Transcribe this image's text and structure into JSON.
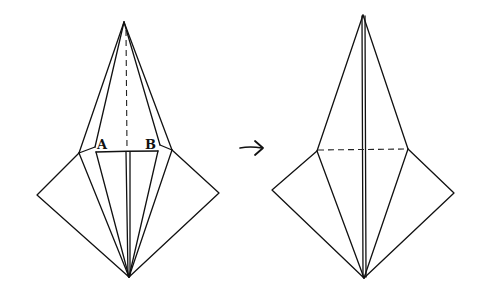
{
  "diagram": {
    "type": "origami-fold-step",
    "step_before": {
      "labels": [
        "A",
        "B"
      ],
      "fold_line": "vertical dashed valley line from apex to A-B edge"
    },
    "arrow": {
      "direction": "right",
      "meaning": "results in"
    },
    "step_after": {
      "fold_line": "horizontal dashed line across shoulders"
    }
  },
  "labels": {
    "a": "A",
    "b": "B"
  },
  "colors": {
    "line": "#111111",
    "background": "#ffffff"
  }
}
